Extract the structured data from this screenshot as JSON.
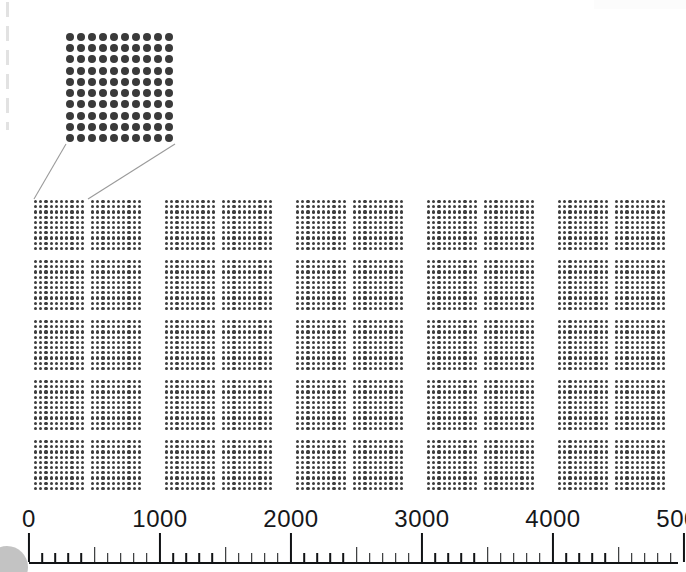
{
  "colors": {
    "dot": "#3d3d3d",
    "magnified_dot": "#3a3a3a",
    "axis": "#111315",
    "callout_line": "#9a9a9a",
    "label_text": "#15171a",
    "page_edge_dash": "#e2e2e2",
    "corner_blob": "#b9b9b9",
    "background": "#ffffff"
  },
  "magnified": {
    "name": "magnified-unit-block",
    "rows": 10,
    "columns": 10,
    "dot_count": 100,
    "represents": "100"
  },
  "callout": {
    "lines": 2,
    "from": "magnified-block-bottom-corners",
    "to": "first-small-block-top-corners"
  },
  "grid": {
    "rows": 5,
    "blocks_per_row": 10,
    "pairs_per_row": 5,
    "total_blocks": 50,
    "dots_per_block": 100,
    "block_rows": 10,
    "block_columns": 10,
    "total_dots": 5000,
    "block_size_px": 52,
    "row_pitch_px": 60,
    "pair_inner_gap_px": 5,
    "pair_pitch_px": 131,
    "field_left_px": 33,
    "field_top_px": 199
  },
  "axis": {
    "type": "linear-ruler",
    "min": 0,
    "max": 5200,
    "origin_x_px": 29,
    "px_per_1000": 131,
    "major_interval": 1000,
    "mid_interval": 500,
    "minor_interval": 100,
    "labels": [
      {
        "value": 0,
        "text": "0"
      },
      {
        "value": 1000,
        "text": "1000"
      },
      {
        "value": 2000,
        "text": "2000"
      },
      {
        "value": 3000,
        "text": "3000"
      },
      {
        "value": 4000,
        "text": "4000"
      },
      {
        "value": 5000,
        "text": "5000"
      }
    ],
    "tick_values": [
      0,
      100,
      200,
      300,
      400,
      500,
      600,
      700,
      800,
      900,
      1000,
      1100,
      1200,
      1300,
      1400,
      1500,
      1600,
      1700,
      1800,
      1900,
      2000,
      2100,
      2200,
      2300,
      2400,
      2500,
      2600,
      2700,
      2800,
      2900,
      3000,
      3100,
      3200,
      3300,
      3400,
      3500,
      3600,
      3700,
      3800,
      3900,
      4000,
      4100,
      4200,
      4300,
      4400,
      4500,
      4600,
      4700,
      4800,
      4900,
      5000
    ]
  },
  "chart_data": {
    "type": "bar",
    "xlabel": "",
    "ylabel": "",
    "xlim": [
      0,
      5200
    ],
    "grid": false,
    "legend": null,
    "categories": [
      "0-1000",
      "1000-2000",
      "2000-3000",
      "3000-4000",
      "4000-5000"
    ],
    "values": [
      1000,
      1000,
      1000,
      1000,
      1000
    ],
    "tick_labels": [
      "0",
      "1000",
      "2000",
      "3000",
      "4000",
      "5000"
    ]
  }
}
